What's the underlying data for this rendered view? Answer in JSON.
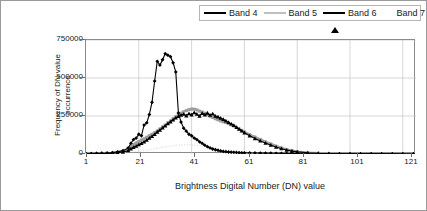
{
  "chart_data": {
    "type": "line",
    "title": "",
    "xlabel": "Brightness Digital Number (DN) value",
    "ylabel": "Frequency of DN value occurrence",
    "xlim": [
      1,
      126
    ],
    "ylim": [
      0,
      750000
    ],
    "xticks": [
      1,
      21,
      41,
      61,
      81,
      101,
      121
    ],
    "yticks": [
      0,
      250000,
      500000,
      750000
    ],
    "grid": true,
    "legend_position": "top-right",
    "x": [
      1,
      3,
      5,
      7,
      9,
      11,
      13,
      15,
      17,
      18,
      19,
      20,
      21,
      22,
      23,
      24,
      25,
      26,
      27,
      28,
      29,
      30,
      31,
      32,
      33,
      34,
      35,
      36,
      37,
      38,
      39,
      40,
      41,
      42,
      43,
      44,
      45,
      46,
      47,
      48,
      49,
      50,
      51,
      52,
      53,
      54,
      55,
      56,
      57,
      58,
      59,
      60,
      61,
      63,
      65,
      67,
      69,
      71,
      73,
      75,
      77,
      79,
      81,
      85,
      89,
      93,
      97,
      101,
      105,
      109,
      113,
      117,
      121,
      125
    ],
    "series": [
      {
        "name": "Band 4",
        "color": "#000000",
        "marker": "diamond",
        "values": [
          2000,
          3000,
          4000,
          5000,
          6000,
          9000,
          14000,
          22000,
          40000,
          70000,
          95000,
          105000,
          130000,
          120000,
          190000,
          205000,
          260000,
          340000,
          480000,
          610000,
          585000,
          620000,
          660000,
          650000,
          640000,
          600000,
          540000,
          270000,
          210000,
          170000,
          150000,
          130000,
          120000,
          105000,
          95000,
          80000,
          70000,
          58000,
          48000,
          40000,
          33000,
          28000,
          24000,
          20000,
          17000,
          15000,
          13000,
          12000,
          11000,
          10000,
          9000,
          8000,
          7500,
          7000,
          6500,
          6000,
          5500,
          5000,
          4500,
          4000,
          3500,
          3000,
          2500,
          2000,
          1500,
          1200,
          1000,
          900,
          800,
          700,
          600,
          500,
          400,
          300
        ]
      },
      {
        "name": "Band 5",
        "color": "#9e9e9e",
        "marker": "square",
        "values": [
          1500,
          2000,
          3000,
          4000,
          5000,
          7000,
          11000,
          18000,
          32000,
          48000,
          62000,
          72000,
          82000,
          92000,
          100000,
          110000,
          120000,
          130000,
          140000,
          152000,
          165000,
          178000,
          190000,
          205000,
          218000,
          232000,
          245000,
          258000,
          268000,
          278000,
          286000,
          292000,
          296000,
          295000,
          290000,
          282000,
          276000,
          268000,
          258000,
          248000,
          240000,
          232000,
          225000,
          218000,
          212000,
          206000,
          200000,
          192000,
          184000,
          175000,
          165000,
          155000,
          145000,
          128000,
          112000,
          96000,
          80000,
          66000,
          52000,
          40000,
          30000,
          22000,
          16000,
          9000,
          5000,
          3000,
          2000,
          1500,
          1200,
          1000,
          800,
          600,
          500,
          400
        ]
      },
      {
        "name": "Band 6",
        "color": "#000000",
        "marker": "triangle",
        "values": [
          1000,
          1500,
          2000,
          2500,
          3500,
          5000,
          8000,
          13000,
          22000,
          34000,
          44000,
          52000,
          62000,
          70000,
          80000,
          92000,
          104000,
          116000,
          130000,
          145000,
          158000,
          172000,
          186000,
          200000,
          212000,
          225000,
          238000,
          248000,
          256000,
          262000,
          252000,
          266000,
          258000,
          272000,
          262000,
          250000,
          268000,
          258000,
          270000,
          256000,
          264000,
          250000,
          244000,
          236000,
          228000,
          218000,
          208000,
          198000,
          188000,
          176000,
          164000,
          152000,
          140000,
          120000,
          102000,
          86000,
          72000,
          58000,
          46000,
          35000,
          26000,
          19000,
          14000,
          8000,
          4500,
          2800,
          1800,
          1300,
          1000,
          800,
          650,
          500,
          400,
          300
        ]
      },
      {
        "name": "Band 7",
        "color": "#c9c9c9",
        "marker": "none",
        "values": [
          800,
          1000,
          1400,
          1800,
          2400,
          3200,
          4500,
          6500,
          9000,
          11000,
          13000,
          15000,
          17500,
          20000,
          22500,
          25000,
          28000,
          31000,
          34000,
          37000,
          40000,
          43000,
          46000,
          49000,
          52000,
          55000,
          57000,
          59000,
          60000,
          61000,
          61500,
          61000,
          60000,
          58500,
          57000,
          55000,
          53000,
          50000,
          47000,
          44000,
          41000,
          38000,
          35000,
          32000,
          29000,
          27000,
          25000,
          23000,
          21000,
          19000,
          17000,
          15500,
          14000,
          11500,
          9500,
          8000,
          6500,
          5500,
          4500,
          3800,
          3200,
          2700,
          2300,
          1800,
          1400,
          1200,
          1000,
          900,
          800,
          750,
          700,
          650,
          600,
          550
        ]
      }
    ]
  },
  "legend": {
    "items": [
      {
        "label": "Band 4"
      },
      {
        "label": "Band 5"
      },
      {
        "label": "Band 6"
      },
      {
        "label": "Band 7"
      }
    ]
  },
  "axes": {
    "y_title_line1": "Frequency of DN value",
    "y_title_line2": "occurrence",
    "x_title": "Brightness Digital Number (DN) value",
    "y_tick_labels": [
      "750000",
      "500000",
      "250000",
      "0"
    ],
    "x_tick_labels": [
      "1",
      "21",
      "41",
      "61",
      "81",
      "101",
      "121"
    ]
  }
}
